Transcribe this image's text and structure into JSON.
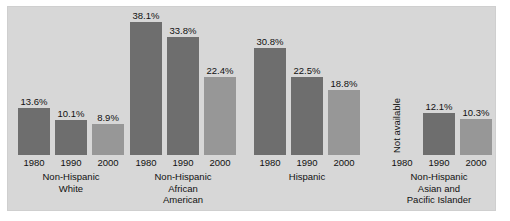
{
  "chart_data": {
    "type": "bar",
    "title": "",
    "subtitle": "",
    "xlabel": "",
    "ylabel": "",
    "ylim": [
      0,
      40
    ],
    "grid": false,
    "legend": "none",
    "categories": [
      "1980",
      "1990",
      "2000"
    ],
    "groups": [
      {
        "name": "Non-Hispanic White",
        "caption_lines": [
          "Non-Hispanic",
          "White"
        ],
        "bars": [
          {
            "year": "1980",
            "value": 13.6,
            "label": "13.6%",
            "available": true
          },
          {
            "year": "1990",
            "value": 10.1,
            "label": "10.1%",
            "available": true
          },
          {
            "year": "2000",
            "value": 8.9,
            "label": "8.9%",
            "available": true
          }
        ]
      },
      {
        "name": "Non-Hispanic African American",
        "caption_lines": [
          "Non-Hispanic",
          "African",
          "American"
        ],
        "bars": [
          {
            "year": "1980",
            "value": 38.1,
            "label": "38.1%",
            "available": true
          },
          {
            "year": "1990",
            "value": 33.8,
            "label": "33.8%",
            "available": true
          },
          {
            "year": "2000",
            "value": 22.4,
            "label": "22.4%",
            "available": true
          }
        ]
      },
      {
        "name": "Hispanic",
        "caption_lines": [
          "Hispanic"
        ],
        "bars": [
          {
            "year": "1980",
            "value": 30.8,
            "label": "30.8%",
            "available": true
          },
          {
            "year": "1990",
            "value": 22.5,
            "label": "22.5%",
            "available": true
          },
          {
            "year": "2000",
            "value": 18.8,
            "label": "18.8%",
            "available": true
          }
        ]
      },
      {
        "name": "Non-Hispanic Asian and Pacific Islander",
        "caption_lines": [
          "Non-Hispanic",
          "Asian and",
          "Pacific Islander"
        ],
        "bars": [
          {
            "year": "1980",
            "value": null,
            "label": "Not available",
            "available": false
          },
          {
            "year": "1990",
            "value": 12.1,
            "label": "12.1%",
            "available": true
          },
          {
            "year": "2000",
            "value": 10.3,
            "label": "10.3%",
            "available": true
          }
        ]
      }
    ],
    "colors": {
      "bar_1980": "#6e6e6e",
      "bar_1990": "#6e6e6e",
      "bar_2000": "#979797",
      "panel_background": "#d7d7d7",
      "page_background": "#ffffff",
      "text": "#111111"
    }
  }
}
